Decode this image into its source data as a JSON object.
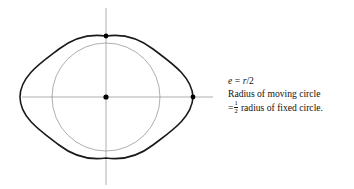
{
  "figure": {
    "colors": {
      "curve": "#1a1a1a",
      "circle": "#8c8c8c",
      "axis": "#8c8c8c",
      "dot": "#000000",
      "text": "#111111",
      "background": "#ffffff"
    },
    "geometry": {
      "origin_x": 106,
      "origin_y": 97,
      "fixed_circle_radius": 54,
      "curve_half_width": 86,
      "curve_half_height": 61,
      "h_axis_x1": 22,
      "h_axis_x2": 213,
      "v_axis_y1": 8,
      "v_axis_y2": 185,
      "curve_stroke_width": 1.6,
      "circle_stroke_width": 0.7,
      "axis_stroke_width": 0.7
    },
    "points": [
      {
        "name": "center-point",
        "label": "center",
        "x": 106,
        "y": 97,
        "r": 2.6
      },
      {
        "name": "top-cusp-point",
        "label": "top cusp",
        "x": 106,
        "y": 36,
        "r": 2.4
      },
      {
        "name": "right-vertex-point",
        "label": "right vertex",
        "x": 193,
        "y": 97,
        "r": 2.4
      }
    ],
    "elements": {
      "outer_curve_name": "moving-point-traced-curve",
      "inner_circle_name": "fixed-circle",
      "h_axis_name": "horizontal-axis",
      "v_axis_name": "vertical-axis"
    }
  },
  "caption": {
    "line1": {
      "var": "e",
      "equals": "=",
      "value_num": "r",
      "slash": "/",
      "value_den": "2",
      "full": "e = r/2"
    },
    "line2": "Radius of moving circle",
    "line3": {
      "equals": "=",
      "frac_num": "1",
      "frac_den": "2",
      "rest": "radius of fixed circle.",
      "full": "= 1/2 radius of fixed circle."
    }
  }
}
